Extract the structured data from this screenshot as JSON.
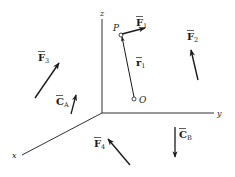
{
  "diagram": {
    "axes": {
      "x": {
        "label": "x"
      },
      "y": {
        "label": "y"
      },
      "z": {
        "label": "z"
      }
    },
    "points": {
      "P": {
        "label": "P"
      },
      "O": {
        "label": "O"
      }
    },
    "vectors": {
      "F1": {
        "symbol": "F",
        "subscript": "1",
        "bar": "‾"
      },
      "F2": {
        "symbol": "F",
        "subscript": "2",
        "bar": "‾"
      },
      "F3": {
        "symbol": "F",
        "subscript": "3",
        "bar": "‾"
      },
      "F4": {
        "symbol": "F",
        "subscript": "4",
        "bar": "‾"
      },
      "r1": {
        "symbol": "r",
        "subscript": "1",
        "bar": "‾"
      },
      "CA": {
        "symbol": "C",
        "subscript": "A",
        "bar": "‾"
      },
      "CB": {
        "symbol": "C",
        "subscript": "B",
        "bar": "‾"
      }
    },
    "colors": {
      "line": "#1a1a1a",
      "background": "#ffffff"
    }
  }
}
